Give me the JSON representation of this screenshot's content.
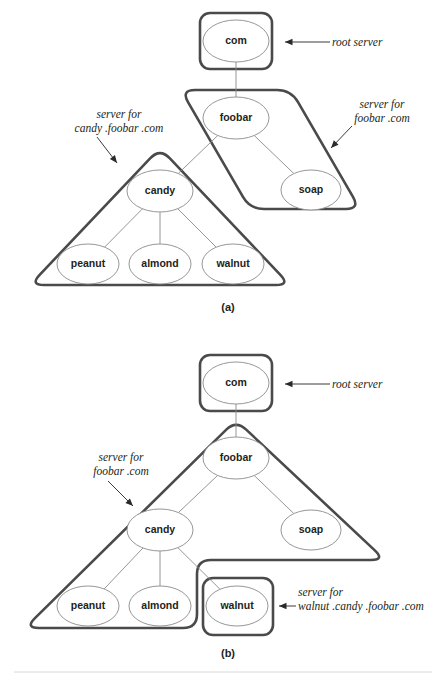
{
  "figure": {
    "background_color": "#ffffff",
    "node_stroke_color": "#8a8a8a",
    "zone_stroke_color": "#4a4a4a",
    "text_color": "#231f20",
    "panels": [
      {
        "id": "a",
        "caption": "(a)",
        "nodes": [
          {
            "id": "com",
            "label": "com",
            "cx": 236,
            "cy": 41,
            "rx": 33,
            "ry": 21
          },
          {
            "id": "foobar",
            "label": "foobar",
            "cx": 236,
            "cy": 118,
            "rx": 33,
            "ry": 21
          },
          {
            "id": "soap",
            "label": "soap",
            "cx": 311,
            "cy": 190,
            "rx": 30,
            "ry": 20
          },
          {
            "id": "candy",
            "label": "candy",
            "cx": 160,
            "cy": 191,
            "rx": 33,
            "ry": 21
          },
          {
            "id": "peanut",
            "label": "peanut",
            "cx": 88,
            "cy": 264,
            "rx": 31,
            "ry": 20
          },
          {
            "id": "almond",
            "label": "almond",
            "cx": 160,
            "cy": 264,
            "rx": 31,
            "ry": 20
          },
          {
            "id": "walnut",
            "label": "walnut",
            "cx": 233,
            "cy": 264,
            "rx": 31,
            "ry": 20
          }
        ],
        "edges": [
          {
            "from": "com",
            "to": "foobar"
          },
          {
            "from": "foobar",
            "to": "candy"
          },
          {
            "from": "foobar",
            "to": "soap"
          },
          {
            "from": "candy",
            "to": "peanut"
          },
          {
            "from": "candy",
            "to": "almond"
          },
          {
            "from": "candy",
            "to": "walnut"
          }
        ],
        "zones": [
          {
            "id": "root-zone",
            "shape": "rounded-rect",
            "x": 200,
            "y": 13,
            "width": 72,
            "height": 56,
            "radius": 10
          },
          {
            "id": "foobar-zone",
            "shape": "parallelogram",
            "points": "181,90 291,90 360,209 250,209"
          },
          {
            "id": "candy-zone",
            "shape": "triangle",
            "points": "160,148 290,285 30,285"
          }
        ],
        "callouts": [
          {
            "id": "root-server",
            "lines": [
              "root server"
            ],
            "text_x": 332,
            "text_y": 46,
            "anchor": "start",
            "arrow": {
              "x1": 330,
              "y1": 42,
              "x2": 285,
              "y2": 42,
              "head": "left"
            }
          },
          {
            "id": "server-for-foobar-com",
            "lines": [
              "server for",
              "foobar .com"
            ],
            "text_x": 382,
            "text_y": 108,
            "anchor": "middle",
            "arrow": {
              "x1": 352,
              "y1": 126,
              "x2": 331,
              "y2": 148,
              "head": "diag-down-left"
            }
          },
          {
            "id": "server-for-candy-foobar-com",
            "lines": [
              "server for",
              "candy .foobar .com"
            ],
            "text_x": 119,
            "text_y": 118,
            "anchor": "middle",
            "arrow": {
              "x1": 97,
              "y1": 137,
              "x2": 117,
              "y2": 163,
              "head": "diag-down-right"
            }
          }
        ]
      },
      {
        "id": "b",
        "caption": "(b)",
        "nodes": [
          {
            "id": "com",
            "label": "com",
            "cx": 236,
            "cy": 383,
            "rx": 33,
            "ry": 21
          },
          {
            "id": "foobar",
            "label": "foobar",
            "cx": 236,
            "cy": 458,
            "rx": 33,
            "ry": 21
          },
          {
            "id": "soap",
            "label": "soap",
            "cx": 311,
            "cy": 530,
            "rx": 30,
            "ry": 20
          },
          {
            "id": "candy",
            "label": "candy",
            "cx": 160,
            "cy": 530,
            "rx": 33,
            "ry": 21
          },
          {
            "id": "peanut",
            "label": "peanut",
            "cx": 88,
            "cy": 606,
            "rx": 31,
            "ry": 20
          },
          {
            "id": "almond",
            "label": "almond",
            "cx": 160,
            "cy": 606,
            "rx": 31,
            "ry": 20
          },
          {
            "id": "walnut",
            "label": "walnut",
            "cx": 237,
            "cy": 606,
            "rx": 31,
            "ry": 20
          }
        ],
        "edges": [
          {
            "from": "com",
            "to": "foobar"
          },
          {
            "from": "foobar",
            "to": "candy"
          },
          {
            "from": "foobar",
            "to": "soap"
          },
          {
            "from": "candy",
            "to": "peanut"
          },
          {
            "from": "candy",
            "to": "almond"
          },
          {
            "from": "candy",
            "to": "walnut"
          }
        ],
        "zones": [
          {
            "id": "root-zone",
            "shape": "rounded-rect",
            "x": 200,
            "y": 355,
            "width": 72,
            "height": 56,
            "radius": 10
          },
          {
            "id": "foobar-zone",
            "shape": "notched-triangle",
            "points": "236,420 385,560 197,560 197,628 25,628"
          },
          {
            "id": "walnut-zone",
            "shape": "rounded-rect",
            "x": 203,
            "y": 578,
            "width": 70,
            "height": 57,
            "radius": 10
          }
        ],
        "callouts": [
          {
            "id": "root-server",
            "lines": [
              "root server"
            ],
            "text_x": 332,
            "text_y": 388,
            "anchor": "start",
            "arrow": {
              "x1": 330,
              "y1": 384,
              "x2": 285,
              "y2": 384,
              "head": "left"
            }
          },
          {
            "id": "server-for-foobar-com",
            "lines": [
              "server for",
              "foobar .com"
            ],
            "text_x": 121,
            "text_y": 461,
            "anchor": "middle",
            "arrow": {
              "x1": 108,
              "y1": 481,
              "x2": 133,
              "y2": 506,
              "head": "diag-down-right"
            }
          },
          {
            "id": "server-for-walnut-candy-foobar-com",
            "lines": [
              "server for",
              "walnut .candy .foobar .com"
            ],
            "text_x": 298,
            "text_y": 596,
            "anchor": "start",
            "arrow": {
              "x1": 296,
              "y1": 606,
              "x2": 279,
              "y2": 606,
              "head": "left"
            }
          }
        ]
      }
    ]
  }
}
